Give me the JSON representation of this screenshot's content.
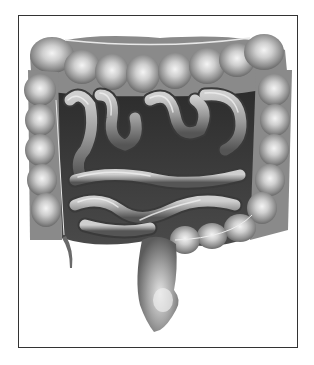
{
  "figure": {
    "style": "grayscale pencil shading",
    "frame_color": "#333333",
    "background_color": "#ffffff",
    "colors": {
      "highlight": "#f2f2f2",
      "mid": "#9a9a9a",
      "shadow": "#3a3a3a",
      "deep": "#1e1e1e"
    },
    "parts": [
      "ascending-colon",
      "transverse-colon",
      "descending-colon",
      "sigmoid-colon",
      "rectum",
      "appendix",
      "small-intestine"
    ]
  }
}
